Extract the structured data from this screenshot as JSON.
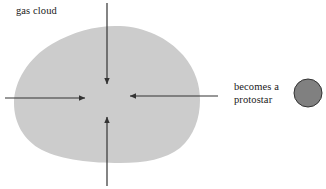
{
  "diagram": {
    "canvas": {
      "width": 326,
      "height": 189,
      "background": "#ffffff"
    },
    "labels": {
      "gas_cloud": "gas cloud",
      "protostar": "becomes a\nprotostar"
    },
    "shapes": {
      "cloud": {
        "name": "gas-cloud",
        "fill": "#cccccc",
        "stroke": "none",
        "path": "M 14,103 C 14,82 28,58 52,44 C 74,31 98,25 120,26 C 145,27 168,38 183,55 C 196,70 200,86 200,100 C 200,118 194,136 180,148 C 166,159 145,163 120,163 C 92,163 62,160 42,150 C 23,140 14,122 14,103 Z"
      },
      "protostar": {
        "name": "protostar-circle",
        "fill": "#808080",
        "stroke": "#333333",
        "stroke_width": 1,
        "cx": 308,
        "cy": 93,
        "r": 14
      }
    },
    "arrows": [
      {
        "name": "arrow-top-down",
        "direction": "down",
        "x1": 107,
        "y1": 3,
        "x2": 107,
        "y2": 84,
        "color": "#333333"
      },
      {
        "name": "arrow-bottom-up",
        "direction": "up",
        "x1": 107,
        "y1": 186,
        "x2": 107,
        "y2": 117,
        "color": "#333333"
      },
      {
        "name": "arrow-left-right",
        "direction": "right",
        "x1": 5,
        "y1": 98,
        "x2": 85,
        "y2": 98,
        "color": "#333333"
      },
      {
        "name": "arrow-right-left",
        "direction": "left",
        "x1": 218,
        "y1": 96,
        "x2": 130,
        "y2": 96,
        "color": "#333333"
      }
    ]
  }
}
